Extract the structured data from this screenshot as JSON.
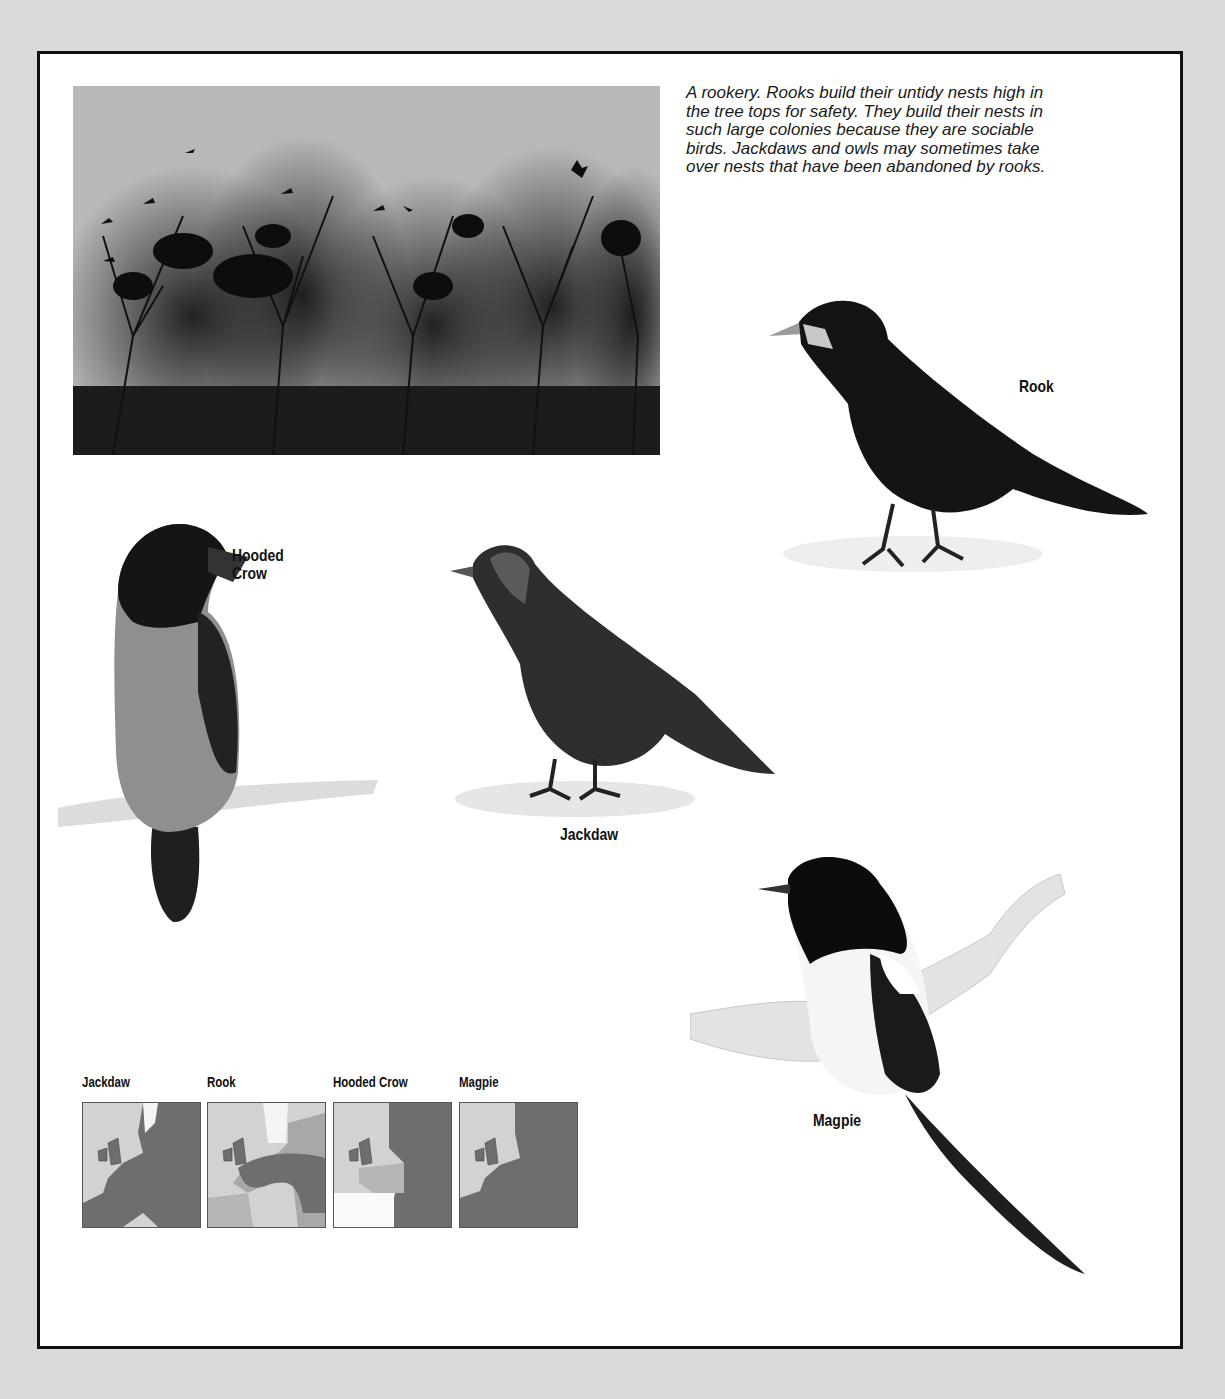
{
  "photo": {
    "alt": "Rookery photograph: rooks' nests in bare treetops with birds flying overhead"
  },
  "caption": "A rookery. Rooks build their untidy nests high in the tree tops for safety. They build their nests in such large colonies because they are sociable birds. Jackdaws and owls may sometimes take over nests that have been abandoned by rooks.",
  "illustrations": [
    {
      "name": "Rook",
      "label": "Rook"
    },
    {
      "name": "Hooded Crow",
      "label_line1": "Hooded",
      "label_line2": "Crow"
    },
    {
      "name": "Jackdaw",
      "label": "Jackdaw"
    },
    {
      "name": "Magpie",
      "label": "Magpie"
    }
  ],
  "range_maps": [
    {
      "title": "Jackdaw"
    },
    {
      "title": "Rook"
    },
    {
      "title": "Hooded Crow"
    },
    {
      "title": "Magpie"
    }
  ],
  "colors": {
    "background": "#d9d9d9",
    "page": "#ffffff",
    "frame": "#111111",
    "range_fill": "#6e6e6e",
    "range_partial": "#b0b0b0",
    "sea": "#d2d2d2"
  }
}
